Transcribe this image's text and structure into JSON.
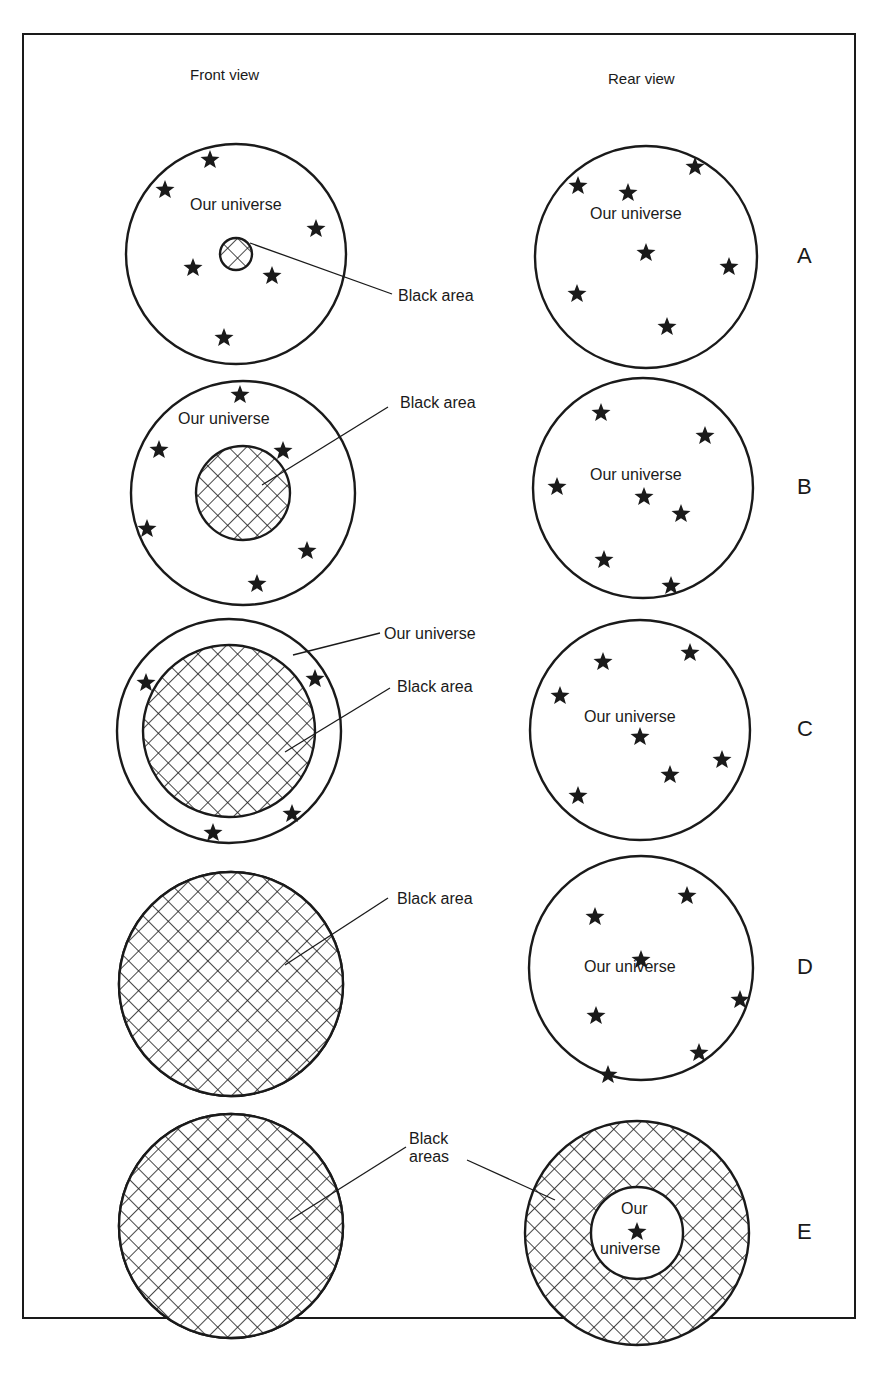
{
  "figure": {
    "column_headers": {
      "front": "Front view",
      "rear": "Rear view"
    },
    "colors": {
      "ink": "#1a1a1a",
      "paper": "#ffffff"
    },
    "rows": [
      {
        "letter": "A",
        "front": {
          "cx": 236,
          "cy": 254,
          "r": 110,
          "black_r": 16,
          "black_type": "disc",
          "stars": [
            [
              210,
              160
            ],
            [
              165,
              190
            ],
            [
              316,
              229
            ],
            [
              193,
              268
            ],
            [
              272,
              276
            ],
            [
              224,
              338
            ]
          ],
          "labels": [
            {
              "text": "Our universe",
              "x": 190,
              "y": 196
            },
            {
              "text": "Black area",
              "x": 398,
              "y": 287,
              "leader": [
                [
                  250,
                  243
                ],
                [
                  392,
                  294
                ]
              ]
            }
          ]
        },
        "rear": {
          "cx": 646,
          "cy": 257,
          "r": 111,
          "ring_inner_r": 0,
          "stars": [
            [
              578,
              186
            ],
            [
              628,
              193
            ],
            [
              695,
              167
            ],
            [
              646,
              253
            ],
            [
              729,
              267
            ],
            [
              577,
              294
            ],
            [
              667,
              327
            ]
          ],
          "labels": [
            {
              "text": "Our universe",
              "x": 590,
              "y": 205
            }
          ]
        }
      },
      {
        "letter": "B",
        "front": {
          "cx": 243,
          "cy": 493,
          "r": 112,
          "black_r": 47,
          "black_type": "disc",
          "stars": [
            [
              240,
              395
            ],
            [
              159,
              450
            ],
            [
              283,
              451
            ],
            [
              147,
              529
            ],
            [
              307,
              551
            ],
            [
              257,
              584
            ]
          ],
          "labels": [
            {
              "text": "Our universe",
              "x": 178,
              "y": 410
            },
            {
              "text": "Black area",
              "x": 400,
              "y": 394,
              "leader": [
                [
                  262,
                  485
                ],
                [
                  388,
                  407
                ]
              ]
            }
          ]
        },
        "rear": {
          "cx": 643,
          "cy": 488,
          "r": 110,
          "ring_inner_r": 0,
          "stars": [
            [
              601,
              413
            ],
            [
              705,
              436
            ],
            [
              557,
              487
            ],
            [
              644,
              497
            ],
            [
              681,
              514
            ],
            [
              604,
              560
            ],
            [
              671,
              586
            ]
          ],
          "labels": [
            {
              "text": "Our universe",
              "x": 590,
              "y": 466
            }
          ]
        }
      },
      {
        "letter": "C",
        "front": {
          "cx": 229,
          "cy": 731,
          "r": 112,
          "black_r": 86,
          "black_type": "disc",
          "stars": [
            [
              146,
              683
            ],
            [
              315,
              679
            ],
            [
              292,
              814
            ],
            [
              213,
              833
            ]
          ],
          "labels": [
            {
              "text": "Our universe",
              "x": 384,
              "y": 625,
              "leader": [
                [
                  293,
                  655
                ],
                [
                  380,
                  633
                ]
              ]
            },
            {
              "text": "Black area",
              "x": 397,
              "y": 678,
              "leader": [
                [
                  285,
                  752
                ],
                [
                  390,
                  688
                ]
              ]
            }
          ]
        },
        "rear": {
          "cx": 640,
          "cy": 730,
          "r": 110,
          "ring_inner_r": 0,
          "stars": [
            [
              603,
              662
            ],
            [
              690,
              653
            ],
            [
              560,
              696
            ],
            [
              640,
              737
            ],
            [
              670,
              775
            ],
            [
              722,
              760
            ],
            [
              578,
              796
            ]
          ],
          "labels": [
            {
              "text": "Our universe",
              "x": 584,
              "y": 708
            }
          ]
        }
      },
      {
        "letter": "D",
        "front": {
          "cx": 231,
          "cy": 984,
          "r": 112,
          "black_r": 112,
          "black_type": "full",
          "stars": [],
          "labels": [
            {
              "text": "Black area",
              "x": 397,
              "y": 890,
              "leader": [
                [
                  285,
                  965
                ],
                [
                  388,
                  898
                ]
              ]
            }
          ]
        },
        "rear": {
          "cx": 641,
          "cy": 968,
          "r": 112,
          "ring_inner_r": 0,
          "stars": [
            [
              595,
              917
            ],
            [
              687,
              896
            ],
            [
              641,
              960
            ],
            [
              596,
              1016
            ],
            [
              740,
              1000
            ],
            [
              699,
              1053
            ],
            [
              608,
              1075
            ]
          ],
          "labels": [
            {
              "text": "Our universe",
              "x": 584,
              "y": 958
            }
          ]
        }
      },
      {
        "letter": "E",
        "front": {
          "cx": 231,
          "cy": 1226,
          "r": 112,
          "black_r": 112,
          "black_type": "full",
          "stars": [],
          "labels": [
            {
              "text": "Black\nareas",
              "x": 409,
              "y": 1130,
              "leader": [
                [
                  290,
                  1220
                ],
                [
                  406,
                  1147
                ]
              ]
            }
          ]
        },
        "rear": {
          "cx": 637,
          "cy": 1233,
          "r": 112,
          "ring_inner_r": 46,
          "stars": [
            [
              637,
              1232
            ]
          ],
          "labels": [
            {
              "text": "Our",
              "x": 621,
              "y": 1200
            },
            {
              "text": "universe",
              "x": 600,
              "y": 1240
            },
            {
              "text": "",
              "x": 0,
              "y": 0,
              "leader": [
                [
                  467,
                  1160
                ],
                [
                  555,
                  1200
                ]
              ]
            }
          ]
        }
      }
    ]
  }
}
